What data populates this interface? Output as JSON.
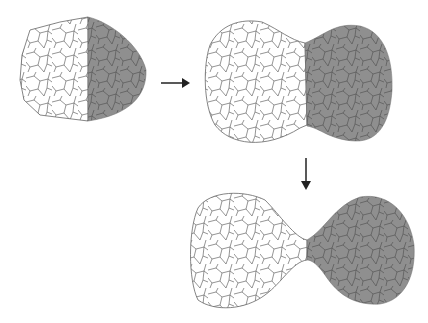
{
  "diagram": {
    "colors": {
      "white_particle": "#ffffff",
      "gray_particle": "#8f8f8f",
      "grain_boundary": "#555555",
      "arrow": "#222222"
    },
    "stages": [
      {
        "id": "stage-1",
        "description": "Two hemispheres in contact"
      },
      {
        "id": "stage-2",
        "description": "Particles merging with wide contact"
      },
      {
        "id": "stage-3",
        "description": "Particles connected by narrow neck"
      }
    ],
    "arrows": [
      {
        "id": "arrow-right",
        "direction": "right",
        "from": "stage-1",
        "to": "stage-2"
      },
      {
        "id": "arrow-down",
        "direction": "down",
        "from": "stage-2",
        "to": "stage-3"
      }
    ]
  }
}
